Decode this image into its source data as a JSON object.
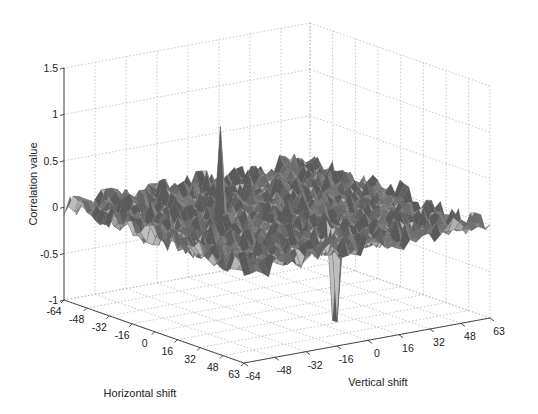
{
  "chart_data": {
    "type": "surface3d",
    "title": "",
    "xlabel": "Horizontal shift",
    "ylabel": "Vertical shift",
    "zlabel": "Correlation value",
    "x_ticks": [
      "-64",
      "-48",
      "-32",
      "-16",
      "0",
      "16",
      "32",
      "48",
      "63"
    ],
    "y_ticks": [
      "-64",
      "-48",
      "-32",
      "-16",
      "0",
      "16",
      "32",
      "48",
      "63"
    ],
    "z_ticks": [
      "-1",
      "-0.5",
      "0",
      "0.5",
      "1",
      "1.5"
    ],
    "xlim": [
      -64,
      63
    ],
    "ylim": [
      -64,
      63
    ],
    "zlim": [
      -1,
      1.5
    ],
    "grid": true,
    "colormap": "gray",
    "surface_baseline": 0.0,
    "noise_amplitude": 0.12,
    "features": [
      {
        "name": "positive peak",
        "horizontal_shift": -10,
        "vertical_shift": -22,
        "value": 1.0
      },
      {
        "name": "negative peak",
        "horizontal_shift": 36,
        "vertical_shift": 2,
        "value": -0.95
      }
    ]
  },
  "labels": {
    "xlabel": "Horizontal shift",
    "ylabel": "Vertical shift",
    "zlabel": "Correlation value"
  }
}
